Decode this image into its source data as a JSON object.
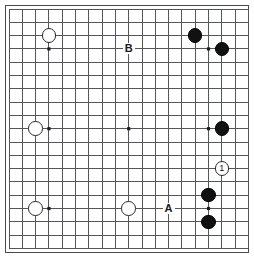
{
  "board": {
    "title": "Go board diagram",
    "size": 19,
    "cell_px": 13.3,
    "origin_x_px": 9,
    "origin_y_px": 9,
    "line_color": "#55565a",
    "border_color": "#4a4a4a",
    "background_color": "#ffffff",
    "black_color": "#111111",
    "white_color": "#ffffff",
    "star_points": [
      {
        "col": 3,
        "row": 3
      },
      {
        "col": 9,
        "row": 3
      },
      {
        "col": 15,
        "row": 3
      },
      {
        "col": 3,
        "row": 9
      },
      {
        "col": 9,
        "row": 9
      },
      {
        "col": 15,
        "row": 9
      },
      {
        "col": 3,
        "row": 15
      },
      {
        "col": 9,
        "row": 15
      },
      {
        "col": 15,
        "row": 15
      }
    ],
    "stones": [
      {
        "col": 3,
        "row": 2,
        "color": "white",
        "label": ""
      },
      {
        "col": 14,
        "row": 2,
        "color": "black",
        "label": ""
      },
      {
        "col": 16,
        "row": 3,
        "color": "black",
        "label": ""
      },
      {
        "col": 2,
        "row": 9,
        "color": "white",
        "label": ""
      },
      {
        "col": 16,
        "row": 9,
        "color": "black",
        "label": ""
      },
      {
        "col": 16,
        "row": 12,
        "color": "white",
        "label": "1"
      },
      {
        "col": 15,
        "row": 14,
        "color": "black",
        "label": ""
      },
      {
        "col": 2,
        "row": 15,
        "color": "white",
        "label": ""
      },
      {
        "col": 9,
        "row": 15,
        "color": "white",
        "label": ""
      },
      {
        "col": 15,
        "row": 16,
        "color": "black",
        "label": ""
      }
    ],
    "markers": [
      {
        "col": 9,
        "row": 3,
        "text": "B"
      },
      {
        "col": 12,
        "row": 15,
        "text": "A"
      }
    ]
  }
}
